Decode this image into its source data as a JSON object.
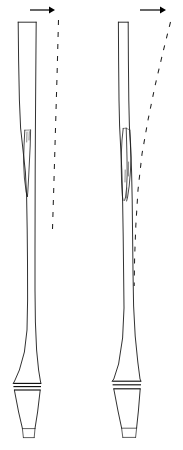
{
  "figure": {
    "type": "line-diagram",
    "width": 183,
    "height": 450,
    "background_color": "#ffffff",
    "stroke_color": "#1a1a1a",
    "panel_count": 2,
    "title": "",
    "caption": ""
  },
  "panels": [
    {
      "id": "left-panel",
      "label": "",
      "column": {
        "name": "tapered-shaft-left",
        "top_y": 22,
        "bottom_y": 438,
        "top_left_x": 18,
        "top_right_x": 36,
        "top_width": 18,
        "waist_left_x": 27,
        "waist_right_x": 35,
        "waist_y": 250,
        "flare_left_x": 13,
        "flare_right_x": 40,
        "description": "narrow rectangular head tapering to slender waist then flaring to banded collar and conical foot"
      },
      "collar": {
        "name": "collar-band-left",
        "top_y": 383,
        "bottom_y": 390,
        "left_x": 13,
        "right_x": 41,
        "line_count": 3
      },
      "foot": {
        "name": "conical-foot-left",
        "top_y": 390,
        "bottom_y": 438,
        "top_left_x": 15,
        "top_right_x": 40,
        "base_left_x": 24,
        "base_right_x": 34,
        "has_base_cap": true
      },
      "fissure": {
        "name": "shaft-fissure-left",
        "start_y": 130,
        "end_y": 196,
        "apex_x": 29,
        "width": 6,
        "description": "narrow elongated wedge-shaped split along shaft"
      },
      "arrow": {
        "name": "direction-arrow-left",
        "direction": "right",
        "x_start": 30,
        "x_end": 53,
        "y": 10,
        "length": 23
      },
      "dashed_line": {
        "name": "reference-line-left",
        "top_x": 58,
        "top_y": 20,
        "bottom_x": 52,
        "bottom_y": 232,
        "slant": "near-vertical",
        "style": "dashed"
      }
    },
    {
      "id": "right-panel",
      "label": "",
      "column": {
        "name": "tapered-shaft-right",
        "top_y": 22,
        "bottom_y": 438,
        "top_left_x": 118,
        "top_right_x": 128,
        "top_width": 10,
        "waist_left_x": 124,
        "waist_right_x": 133,
        "waist_y": 250,
        "flare_left_x": 112,
        "flare_right_x": 140,
        "description": "slender rectangular head widening through a bulge then tapering to banded collar and conical foot"
      },
      "collar": {
        "name": "collar-band-right",
        "top_y": 381,
        "bottom_y": 389,
        "left_x": 112,
        "right_x": 141,
        "line_count": 3
      },
      "foot": {
        "name": "conical-foot-right",
        "top_y": 389,
        "bottom_y": 438,
        "top_left_x": 114,
        "top_right_x": 140,
        "base_left_x": 123,
        "base_right_x": 136,
        "has_base_cap": true
      },
      "fissure": {
        "name": "shaft-fissure-right",
        "start_y": 128,
        "end_y": 200,
        "apex_x": 128,
        "width": 9,
        "description": "pronounced bulge splitting into two converging internal lines"
      },
      "arrow": {
        "name": "direction-arrow-right",
        "direction": "right",
        "x_start": 140,
        "x_end": 165,
        "y": 10,
        "length": 25
      },
      "dashed_line": {
        "name": "reference-line-right",
        "top_x": 170,
        "top_y": 22,
        "bottom_x": 134,
        "bottom_y": 286,
        "slant": "leaning-right-at-top",
        "style": "dashed"
      }
    }
  ]
}
